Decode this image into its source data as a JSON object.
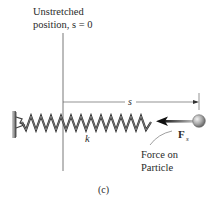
{
  "diagram": {
    "reference_label_line1": "Unstretched",
    "reference_label_line2": "position, s = 0",
    "displacement_label": "s",
    "spring_constant_label": "k",
    "force_label": "F",
    "force_subscript": "s",
    "force_note_line1": "Force on",
    "force_note_line2": "Particle",
    "caption": "(c)"
  },
  "colors": {
    "line": "#555555",
    "spring": "#3a3a3a",
    "wall": "#7a7a7a",
    "particle": "#9a9a9a",
    "text": "#2a2a2a"
  }
}
